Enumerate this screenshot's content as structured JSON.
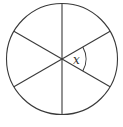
{
  "diagram": {
    "type": "circle-divided-into-sectors",
    "sectors": 6,
    "angle_label": "x",
    "colors": {
      "stroke": "#3a3a3a",
      "background": "#ffffff",
      "label": "#333333"
    }
  }
}
